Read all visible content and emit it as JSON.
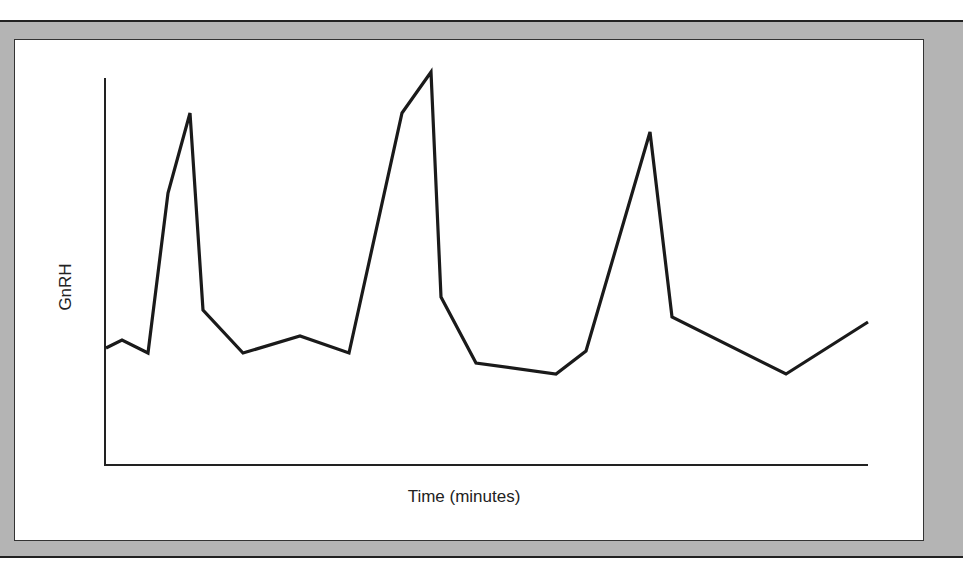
{
  "chart_data": {
    "type": "line",
    "title": "",
    "xlabel": "Time (minutes)",
    "ylabel": "GnRH",
    "x_ticks": [],
    "y_ticks": [],
    "grid": false,
    "legend": null,
    "series": [
      {
        "name": "GnRH",
        "points_px": [
          [
            106,
            348
          ],
          [
            122,
            340
          ],
          [
            148,
            353
          ],
          [
            168,
            193
          ],
          [
            190,
            113
          ],
          [
            203,
            310
          ],
          [
            243,
            353
          ],
          [
            300,
            336
          ],
          [
            349,
            353
          ],
          [
            402,
            113
          ],
          [
            431,
            72
          ],
          [
            441,
            297
          ],
          [
            476,
            363
          ],
          [
            556,
            374
          ],
          [
            586,
            351
          ],
          [
            650,
            132
          ],
          [
            672,
            317
          ],
          [
            786,
            374
          ],
          [
            868,
            322
          ]
        ]
      }
    ],
    "axes_px": {
      "origin": [
        105,
        465
      ],
      "y_top": 78,
      "x_right": 868
    },
    "colors": {
      "line": "#1a1a1a",
      "frame": "#b4b4b4",
      "border": "#222222"
    }
  },
  "labels": {
    "x_axis": "Time (minutes)",
    "y_axis": "GnRH"
  }
}
